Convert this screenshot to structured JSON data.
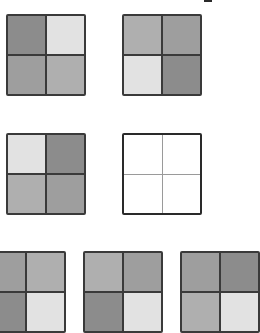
{
  "palette": {
    "dark": "#8c8c8c",
    "medium_dark": "#9e9e9e",
    "medium": "#afafaf",
    "light": "#e2e2e2",
    "empty": "#ffffff"
  },
  "grids": [
    {
      "id": "top-left",
      "x": 6,
      "y": 14,
      "w": 80,
      "h": 82,
      "cells": [
        "dark",
        "light",
        "medium_dark",
        "medium"
      ]
    },
    {
      "id": "top-right",
      "x": 122,
      "y": 14,
      "w": 80,
      "h": 82,
      "cells": [
        "medium",
        "medium_dark",
        "light",
        "dark"
      ]
    },
    {
      "id": "middle-left",
      "x": 6,
      "y": 133,
      "w": 80,
      "h": 82,
      "cells": [
        "light",
        "dark",
        "medium",
        "medium_dark"
      ]
    },
    {
      "id": "middle-right-empty",
      "x": 122,
      "y": 133,
      "w": 80,
      "h": 82,
      "cells": [
        "empty",
        "empty",
        "empty",
        "empty"
      ],
      "empty": true
    },
    {
      "id": "bottom-left",
      "x": -14,
      "y": 251,
      "w": 80,
      "h": 82,
      "cells": [
        "medium_dark",
        "medium",
        "dark",
        "light"
      ]
    },
    {
      "id": "bottom-middle",
      "x": 83,
      "y": 251,
      "w": 80,
      "h": 82,
      "cells": [
        "medium",
        "medium_dark",
        "dark",
        "light"
      ]
    },
    {
      "id": "bottom-right",
      "x": 180,
      "y": 251,
      "w": 80,
      "h": 82,
      "cells": [
        "medium_dark",
        "dark",
        "medium",
        "light"
      ]
    }
  ]
}
